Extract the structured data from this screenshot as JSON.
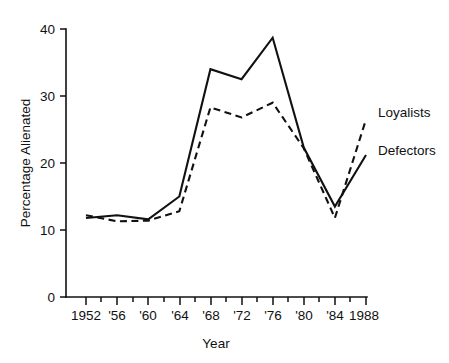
{
  "chart_data": {
    "type": "line",
    "title": "",
    "xlabel": "Year",
    "ylabel": "Percentage Alienated",
    "xlim": [
      1952,
      1988
    ],
    "ylim": [
      0,
      40
    ],
    "yticks": [
      0,
      10,
      20,
      30,
      40
    ],
    "ytick_labels": [
      "0",
      "10",
      "20",
      "30",
      "40"
    ],
    "xticks": [
      1952,
      1956,
      1960,
      1964,
      1968,
      1972,
      1976,
      1980,
      1984,
      1988
    ],
    "xtick_labels": [
      "1952",
      "'56",
      "'60",
      "'64",
      "'68",
      "'72",
      "'76",
      "'80",
      "'84",
      "1988"
    ],
    "xticks_minor": [
      1954,
      1958,
      1962,
      1966,
      1970,
      1974,
      1978,
      1982,
      1986
    ],
    "grid": false,
    "legend_position": "right-inline",
    "x": [
      1952,
      1956,
      1960,
      1964,
      1968,
      1972,
      1976,
      1980,
      1984,
      1988
    ],
    "series": [
      {
        "name": "Loyalists",
        "style": "dashed",
        "values": [
          12.2,
          11.3,
          11.4,
          12.8,
          28.3,
          26.8,
          29.0,
          22.2,
          11.8,
          26.5
        ]
      },
      {
        "name": "Defectors",
        "style": "solid",
        "values": [
          11.8,
          12.2,
          11.6,
          15.0,
          34.0,
          32.5,
          38.7,
          22.3,
          13.5,
          21.2
        ]
      }
    ]
  },
  "labels": {
    "y_axis_title": "Percentage Alienated",
    "x_axis_title": "Year",
    "series_loyalists": "Loyalists",
    "series_defectors": "Defectors",
    "ytick_0": "0",
    "ytick_10": "10",
    "ytick_20": "20",
    "ytick_30": "30",
    "ytick_40": "40",
    "xtick_1952": "1952",
    "xtick_1956": "'56",
    "xtick_1960": "'60",
    "xtick_1964": "'64",
    "xtick_1968": "'68",
    "xtick_1972": "'72",
    "xtick_1976": "'76",
    "xtick_1980": "'80",
    "xtick_1984": "'84",
    "xtick_1988": "1988"
  }
}
